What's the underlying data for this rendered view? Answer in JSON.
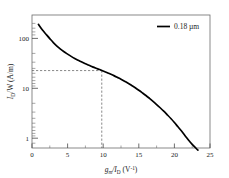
{
  "chart_data": {
    "type": "line",
    "title": "",
    "subtitle": "",
    "xlabel_parts": {
      "g": "g",
      "m": "m",
      "slash": "/I",
      "d": "D",
      "units_open": " (V",
      "exp": "-1",
      "units_close": ")"
    },
    "xlabel": "gm/ID (V^-1)",
    "ylabel_parts": {
      "i": "I",
      "d": "D",
      "w": "/W  (A/m)"
    },
    "ylabel": "ID/W (A/m)",
    "xticks": [
      "0",
      "5",
      "10",
      "15",
      "20",
      "25"
    ],
    "xtick_values": [
      0,
      5,
      10,
      15,
      20,
      25
    ],
    "yticks": [
      "1",
      "10",
      "100"
    ],
    "ytick_values": [
      1,
      10,
      100
    ],
    "xlim": [
      0,
      25
    ],
    "ylim": [
      0.5,
      400
    ],
    "yscale": "log",
    "xscale": "linear",
    "grid": false,
    "legend_position": "top-right",
    "series": [
      {
        "name": "0.18 µm",
        "color": "#000000",
        "x": [
          0.9,
          1.5,
          2.0,
          2.5,
          3.0,
          3.5,
          4.0,
          4.5,
          5.0,
          5.5,
          6.0,
          6.5,
          7.0,
          7.5,
          8.0,
          8.5,
          9.0,
          9.5,
          10.0,
          10.5,
          11.0,
          11.5,
          12.0,
          12.5,
          13.0,
          13.5,
          14.0,
          14.5,
          15.0,
          15.5,
          16.0,
          16.5,
          17.0,
          17.5,
          18.0,
          18.5,
          19.0,
          19.5,
          20.0,
          20.5,
          21.0,
          21.5,
          22.0,
          22.5,
          23.0,
          23.3
        ],
        "y": [
          250,
          185,
          150,
          122,
          100,
          84,
          72,
          63,
          56,
          50,
          45,
          41,
          37.5,
          34.5,
          32,
          29.5,
          27.5,
          25.8,
          24.0,
          22.3,
          20.6,
          19.0,
          17.4,
          15.9,
          14.4,
          13.0,
          11.6,
          10.3,
          9.1,
          8.0,
          7.0,
          6.05,
          5.2,
          4.45,
          3.78,
          3.18,
          2.65,
          2.2,
          1.8,
          1.45,
          1.17,
          0.93,
          0.74,
          0.6,
          0.5,
          0.45
        ]
      }
    ],
    "annotations": [
      {
        "name": "operating-point-guide",
        "type": "dashed-crosshair",
        "x": 9.8,
        "y": 24.5,
        "style": "dashed",
        "color": "#555555"
      }
    ]
  },
  "legend": {
    "entries": [
      {
        "label": "0.18 µm",
        "color": "#000000"
      }
    ]
  }
}
